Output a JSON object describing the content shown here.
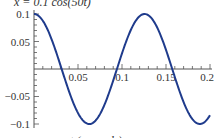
{
  "chart_data": {
    "type": "line",
    "title": "x = 0.1 cos(50t)",
    "xlabel": "t (seconds)",
    "ylabel": "",
    "xlim": [
      0,
      0.2
    ],
    "ylim": [
      -0.1,
      0.1
    ],
    "x_ticks": [
      "0.05",
      "0.1",
      "0.15",
      "0.2"
    ],
    "y_ticks": [
      "0.1",
      "0.05",
      "-0.05",
      "-0.1"
    ],
    "grid": false,
    "series": [
      {
        "name": "x(t)",
        "function": "0.1*cos(50*t)",
        "color": "#1f3b8c",
        "x": [
          0,
          0.02,
          0.0314,
          0.04,
          0.06,
          0.0628,
          0.08,
          0.0942,
          0.1,
          0.12,
          0.1257,
          0.14,
          0.1571,
          0.16,
          0.18,
          0.1885,
          0.2
        ],
        "values": [
          0.1,
          0.054,
          0.0,
          -0.042,
          -0.099,
          -0.1,
          -0.065,
          0.0,
          0.028,
          0.096,
          0.1,
          0.075,
          0.0,
          -0.015,
          -0.091,
          -0.1,
          -0.084
        ]
      }
    ]
  }
}
